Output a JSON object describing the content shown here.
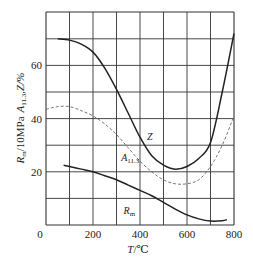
{
  "chart_data": {
    "type": "line",
    "title": "",
    "xlabel": "T/℃",
    "ylabel": "R_m/10MPa  A_11.3,Z/%",
    "xlim": [
      0,
      800
    ],
    "ylim": [
      0,
      77
    ],
    "grid": true,
    "x_ticks": [
      "0",
      "200",
      "400",
      "600",
      "800"
    ],
    "y_ticks": [
      "20",
      "40",
      "60"
    ],
    "series": [
      {
        "name": "Z",
        "style": "solid",
        "x": [
          50,
          100,
          150,
          200,
          250,
          300,
          350,
          400,
          450,
          500,
          550,
          600,
          650,
          700,
          750,
          800
        ],
        "values": [
          70,
          69.5,
          68,
          65,
          59,
          51,
          42,
          33,
          26,
          22.5,
          21,
          22,
          25,
          31,
          50,
          72
        ]
      },
      {
        "name": "A_11.3",
        "style": "dashed",
        "x": [
          0,
          50,
          100,
          150,
          200,
          250,
          300,
          350,
          400,
          450,
          500,
          550,
          600,
          650,
          700,
          750,
          800
        ],
        "values": [
          43.5,
          44.5,
          44.5,
          43,
          41,
          38,
          34,
          29,
          24,
          20,
          17,
          15.5,
          15.5,
          17,
          22,
          30,
          41
        ]
      },
      {
        "name": "R_m",
        "style": "solid",
        "x": [
          75,
          100,
          150,
          200,
          250,
          300,
          350,
          400,
          450,
          500,
          550,
          600,
          650,
          700,
          750,
          770
        ],
        "values": [
          22.5,
          22,
          21,
          20,
          18.5,
          17,
          15,
          13,
          11,
          8.5,
          6,
          3.8,
          2.3,
          1.5,
          1.6,
          2
        ]
      }
    ],
    "annotations": [
      {
        "text": "Z",
        "x": 430,
        "y": 32
      },
      {
        "text": "A",
        "sub": "11.3",
        "x": 320,
        "y": 24
      },
      {
        "text": "R",
        "sub": "m",
        "x": 330,
        "y": 4
      }
    ]
  },
  "labels": {
    "y0": "0",
    "x_axis_title_main": "T",
    "x_axis_title_unit": "/℃",
    "y_axis_title_rm": "R",
    "y_axis_title_rm_sub": "m",
    "y_axis_title_rm_unit": "/10MPa",
    "y_axis_title_a": "A",
    "y_axis_title_a_sub": "11.3",
    "y_axis_title_z": ",Z/%"
  }
}
